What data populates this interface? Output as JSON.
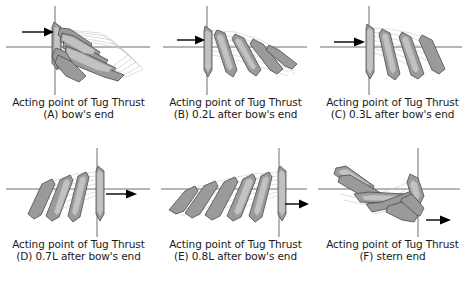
{
  "figure": {
    "caption_common": "Acting point of Tug Thrust",
    "panels": [
      {
        "id": "A",
        "caption_line1": "Acting point of Tug Thrust",
        "caption_line2": "(A) bow's end",
        "arrow_label": "tug-thrust-arrow",
        "arrow_direction": "right",
        "arrow_position": "upper-left",
        "pivot_position": "left",
        "motion": "bow swings down and to the right, hull sweeps a wide arc"
      },
      {
        "id": "B",
        "caption_line1": "Acting point of Tug Thrust",
        "caption_line2": "(B) 0.2L after bow's end",
        "arrow_label": "tug-thrust-arrow",
        "arrow_direction": "right",
        "arrow_position": "left",
        "pivot_position": "left",
        "motion": "hull fans out to the right in a descending sequence"
      },
      {
        "id": "C",
        "caption_line1": "Acting point of Tug Thrust",
        "caption_line2": "(C) 0.3L after bow's end",
        "arrow_label": "tug-thrust-arrow",
        "arrow_direction": "right",
        "arrow_position": "left",
        "pivot_position": "left",
        "motion": "narrow fan of hull positions leaning right"
      },
      {
        "id": "D",
        "caption_line1": "Acting point of Tug Thrust",
        "caption_line2": "(D) 0.7L after bow's end",
        "arrow_label": "tug-thrust-arrow",
        "arrow_direction": "right",
        "arrow_position": "right",
        "pivot_position": "right",
        "motion": "hull fans out to the left in a descending sequence"
      },
      {
        "id": "E",
        "caption_line1": "Acting point of Tug Thrust",
        "caption_line2": "(E) 0.8L after bow's end",
        "arrow_label": "tug-thrust-arrow",
        "arrow_direction": "right",
        "arrow_position": "right",
        "pivot_position": "right",
        "motion": "wide fan of hull positions sweeping far to the left"
      },
      {
        "id": "F",
        "caption_line1": "Acting point of Tug Thrust",
        "caption_line2": "(F) stern end",
        "arrow_label": "tug-thrust-arrow",
        "arrow_direction": "right",
        "arrow_position": "lower-right",
        "pivot_position": "right",
        "motion": "stern pivots, hull sweeps a curved arc up to the left"
      }
    ]
  },
  "colors": {
    "hull_fill": "#9a9a9a",
    "hull_fill_light": "#c9c9c9",
    "hull_outline": "#4a4a4a",
    "ghost_outline": "#bdbdbd",
    "axis": "#6e6e6e",
    "arrow": "#000000",
    "background": "#ffffff",
    "text": "#1a1a1a"
  }
}
